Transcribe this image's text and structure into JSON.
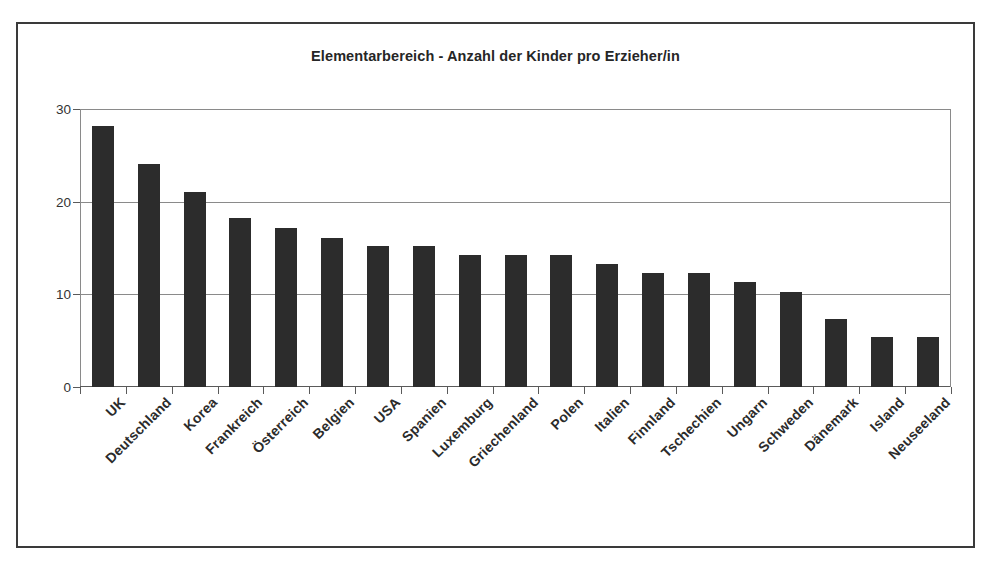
{
  "figure": {
    "border_color": "#3a3a3a",
    "background": "#ffffff"
  },
  "chart_data": {
    "type": "bar",
    "title": "Elementarbereich - Anzahl der Kinder pro Erzieher/in",
    "subtitle": "",
    "xlabel": "",
    "ylabel": "",
    "ylim": [
      0,
      30
    ],
    "yticks": [
      0,
      10,
      20,
      30
    ],
    "ytick_labels": [
      "0",
      "10",
      "20",
      "30"
    ],
    "grid": true,
    "grid_axis": "y",
    "legend": false,
    "legend_position": "none",
    "bar_color": "#2c2c2c",
    "categories": [
      "UK",
      "Deutschland",
      "Korea",
      "Frankreich",
      "Österreich",
      "Belgien",
      "USA",
      "Spanien",
      "Luxemburg",
      "Griechenland",
      "Polen",
      "Italien",
      "Finnland",
      "Tschechien",
      "Ungarn",
      "Schweden",
      "Dänemark",
      "Island",
      "Neuseeland"
    ],
    "values": [
      28.2,
      24.1,
      21.0,
      18.2,
      17.2,
      16.1,
      15.2,
      15.2,
      14.3,
      14.3,
      14.2,
      13.3,
      12.3,
      12.3,
      11.3,
      10.3,
      7.3,
      5.4,
      5.4
    ]
  }
}
